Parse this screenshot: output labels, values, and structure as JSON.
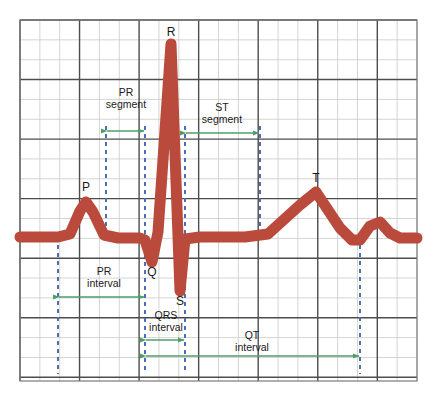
{
  "diagram": {
    "background_color": "#ffffff",
    "grid": {
      "minor_color": "#c9c9c9",
      "major_color": "#4d4d4d",
      "border_color": "#7a7a7a",
      "x0": 20,
      "y0": 20,
      "x1": 417,
      "y1": 381,
      "minor_step": 19.85,
      "major_every": 3
    },
    "trace": {
      "color": "#b94a3c",
      "thickness": 11,
      "baseline_y": 237
    },
    "marker_line": {
      "color": "#4a6fb5",
      "style": "dashed",
      "width": 2
    },
    "arrow": {
      "color": "#4f9e68",
      "width": 1.4
    }
  },
  "wave_labels": [
    {
      "name": "P",
      "text": "P",
      "x": 86,
      "y": 181
    },
    {
      "name": "Q",
      "text": "Q",
      "x": 152,
      "y": 266
    },
    {
      "name": "R",
      "text": "R",
      "x": 171,
      "y": 26
    },
    {
      "name": "S",
      "text": "S",
      "x": 180,
      "y": 295
    },
    {
      "name": "T",
      "text": "T",
      "x": 316,
      "y": 172
    }
  ],
  "measures": [
    {
      "name": "pr-segment",
      "line1": "PR",
      "line2": "segment",
      "x_start": 106,
      "x_end": 145,
      "arrow_y": 131,
      "label_x": 126,
      "label_y": 86
    },
    {
      "name": "st-segment",
      "line1": "ST",
      "line2": "segment",
      "x_start": 185,
      "x_end": 260,
      "arrow_y": 133,
      "label_x": 222,
      "label_y": 101
    },
    {
      "name": "pr-interval",
      "line1": "PR",
      "line2": "interval",
      "x_start": 58,
      "x_end": 145,
      "arrow_y": 297,
      "label_x": 104,
      "label_y": 265
    },
    {
      "name": "qrs-interval",
      "line1": "QRS",
      "line2": "interval",
      "x_start": 145,
      "x_end": 185,
      "arrow_y": 340,
      "label_x": 166,
      "label_y": 309
    },
    {
      "name": "qt-interval",
      "line1": "QT",
      "line2": "interval",
      "x_start": 145,
      "x_end": 360,
      "arrow_y": 356,
      "label_x": 252,
      "label_y": 329
    }
  ],
  "marker_lines": [
    {
      "name": "p-onset",
      "x": 58,
      "y_top": 245,
      "y_bottom": 374
    },
    {
      "name": "p-offset",
      "x": 106,
      "y_top": 126,
      "y_bottom": 232
    },
    {
      "name": "q-onset",
      "x": 145,
      "y_top": 126,
      "y_bottom": 374
    },
    {
      "name": "s-offset",
      "x": 185,
      "y_top": 126,
      "y_bottom": 374
    },
    {
      "name": "st-end",
      "x": 260,
      "y_top": 126,
      "y_bottom": 232
    },
    {
      "name": "t-offset",
      "x": 360,
      "y_top": 245,
      "y_bottom": 374
    }
  ],
  "chart_data": {
    "type": "line",
    "xlabel": "",
    "ylabel": "",
    "series": [
      {
        "name": "ECG trace",
        "points": [
          [
            20,
            237
          ],
          [
            58,
            237
          ],
          [
            70,
            234
          ],
          [
            80,
            211
          ],
          [
            86,
            202
          ],
          [
            93,
            212
          ],
          [
            104,
            235
          ],
          [
            118,
            238
          ],
          [
            140,
            238
          ],
          [
            145,
            240
          ],
          [
            152,
            262
          ],
          [
            158,
            232
          ],
          [
            171,
            44
          ],
          [
            180,
            291
          ],
          [
            185,
            239
          ],
          [
            200,
            237
          ],
          [
            245,
            237
          ],
          [
            268,
            234
          ],
          [
            300,
            205
          ],
          [
            316,
            192
          ],
          [
            340,
            228
          ],
          [
            352,
            240
          ],
          [
            360,
            240
          ],
          [
            370,
            226
          ],
          [
            380,
            222
          ],
          [
            390,
            233
          ],
          [
            400,
            238
          ],
          [
            417,
            238
          ]
        ]
      }
    ],
    "annotations": [
      {
        "label": "P",
        "x": 86,
        "y": 202
      },
      {
        "label": "Q",
        "x": 152,
        "y": 262
      },
      {
        "label": "R",
        "x": 171,
        "y": 44
      },
      {
        "label": "S",
        "x": 180,
        "y": 291
      },
      {
        "label": "T",
        "x": 316,
        "y": 192
      }
    ]
  }
}
